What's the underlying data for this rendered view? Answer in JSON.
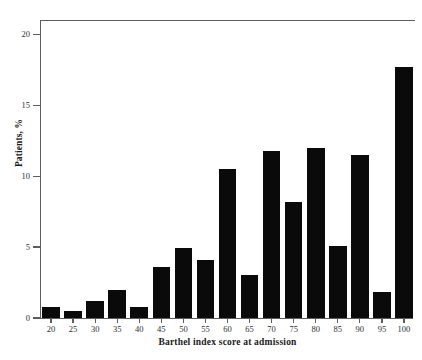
{
  "chart_data": {
    "type": "bar",
    "title": "",
    "xlabel": "Barthel index score at admission",
    "ylabel": "Patients, %",
    "categories": [
      "20",
      "25",
      "30",
      "35",
      "40",
      "45",
      "50",
      "55",
      "60",
      "65",
      "70",
      "75",
      "80",
      "85",
      "90",
      "95",
      "100"
    ],
    "values": [
      0.8,
      0.5,
      1.2,
      2.0,
      0.8,
      3.6,
      4.9,
      4.1,
      10.5,
      3.0,
      11.8,
      8.2,
      12.0,
      5.1,
      11.5,
      1.8,
      17.7
    ],
    "ylim": [
      0,
      21
    ],
    "xlim": [
      17.5,
      102.5
    ],
    "y_ticks": [
      "0",
      "5",
      "10",
      "15",
      "20"
    ],
    "y_tick_values": [
      0,
      5,
      10,
      15,
      20
    ],
    "grid": false,
    "legend": null,
    "bar_color": "#0a0a0a",
    "axis_color": "#5d5d5d"
  },
  "axes": {
    "y_title": "Patients, %",
    "x_title": "Barthel index score at admission"
  }
}
